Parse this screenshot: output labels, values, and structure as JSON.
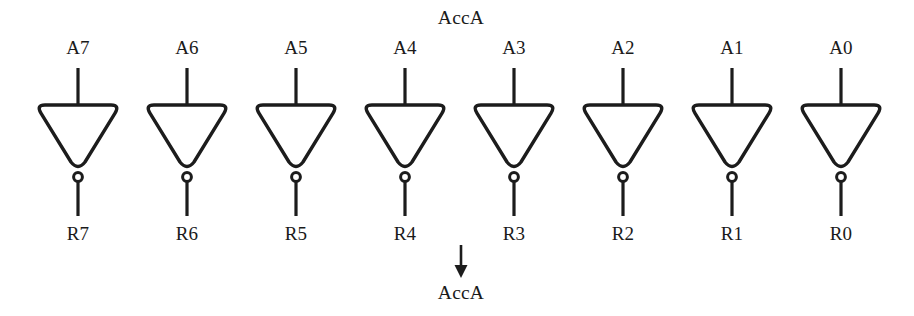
{
  "diagram": {
    "title_top": "AccA",
    "title_bottom": "AccA",
    "type": "inverter-bank",
    "line_color": "#1c1c1c",
    "background_color": "#ffffff",
    "gate_count": 8,
    "gates": [
      {
        "input_label": "A7",
        "output_label": "R7",
        "center_x": 78
      },
      {
        "input_label": "A6",
        "output_label": "R6",
        "center_x": 187
      },
      {
        "input_label": "A5",
        "output_label": "R5",
        "center_x": 296
      },
      {
        "input_label": "A4",
        "output_label": "R4",
        "center_x": 405
      },
      {
        "input_label": "A3",
        "output_label": "R3",
        "center_x": 514
      },
      {
        "input_label": "A2",
        "output_label": "R2",
        "center_x": 623
      },
      {
        "input_label": "A1",
        "output_label": "R1",
        "center_x": 732
      },
      {
        "input_label": "A0",
        "output_label": "R0",
        "center_x": 841
      }
    ],
    "geometry": {
      "input_label_y": 38,
      "input_wire_top": 68,
      "gate_top_y": 105,
      "gate_apex_y": 171,
      "gate_half_width": 42,
      "bubble_cy": 177,
      "bubble_r": 4.4,
      "output_wire_bottom": 216,
      "output_label_y": 224,
      "arrow_x": 461,
      "arrow_top_y": 245,
      "arrow_tip_y": 278,
      "bottom_label_y": 283,
      "top_label_y": 8
    }
  }
}
